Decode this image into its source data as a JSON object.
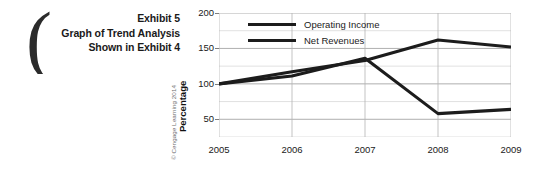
{
  "caption": {
    "bracket_glyph": "(",
    "lines": [
      "Exhibit 5",
      "Graph of Trend Analysis",
      "Shown in Exhibit 4"
    ]
  },
  "credit": "© Cengage Learning 2014",
  "legend": [
    {
      "label": "Operating Income",
      "color": "#1c1c1c"
    },
    {
      "label": "Net Revenues",
      "color": "#1c1c1c"
    }
  ],
  "axis": {
    "y_title": "Percentage",
    "y_ticks": [
      "200",
      "150",
      "100",
      "50"
    ],
    "x_ticks": [
      "2005",
      "2006",
      "2007",
      "2008",
      "2009"
    ]
  },
  "chart_data": {
    "type": "line",
    "title": "Graph of Trend Analysis Shown in Exhibit 4",
    "xlabel": "",
    "ylabel": "Percentage",
    "x": [
      2005,
      2006,
      2007,
      2008,
      2009
    ],
    "categories": [
      "2005",
      "2006",
      "2007",
      "2008",
      "2009"
    ],
    "ylim": [
      25,
      200
    ],
    "yticks": [
      50,
      100,
      150,
      200
    ],
    "grid": true,
    "grid_axis": "y",
    "legend_position": "top-left-inside",
    "series": [
      {
        "name": "Operating Income",
        "color": "#1c1c1c",
        "values": [
          100,
          111,
          136,
          58,
          64
        ]
      },
      {
        "name": "Net Revenues",
        "color": "#1c1c1c",
        "values": [
          100,
          117,
          133,
          162,
          152
        ]
      }
    ]
  }
}
